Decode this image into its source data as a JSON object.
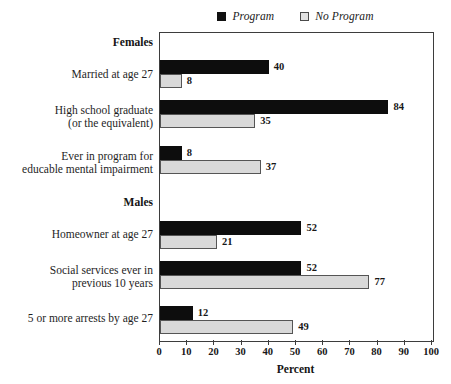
{
  "chart_data": {
    "type": "bar",
    "orientation": "horizontal",
    "title": "",
    "xlabel": "Percent",
    "ylabel": "",
    "xlim": [
      0,
      100
    ],
    "xticks": [
      0,
      10,
      20,
      30,
      40,
      50,
      60,
      70,
      80,
      90,
      100
    ],
    "grid": false,
    "legend_position": "top-center",
    "series": [
      {
        "name": "Program",
        "color": "#0d0d0d"
      },
      {
        "name": "No Program",
        "color": "#d9d9d9"
      }
    ],
    "groups": [
      {
        "name": "Females",
        "categories": [
          {
            "label": "Married at age 27",
            "label_lines": [
              "Married at age 27"
            ],
            "values": {
              "Program": 40,
              "No Program": 8
            }
          },
          {
            "label": "High school graduate (or the equivalent)",
            "label_lines": [
              "High school graduate",
              "(or the equivalent)"
            ],
            "values": {
              "Program": 84,
              "No Program": 35
            }
          },
          {
            "label": "Ever in program for educable mental impairment",
            "label_lines": [
              "Ever in program for",
              "educable mental impairment"
            ],
            "values": {
              "Program": 8,
              "No Program": 37
            }
          }
        ]
      },
      {
        "name": "Males",
        "categories": [
          {
            "label": "Homeowner at age 27",
            "label_lines": [
              "Homeowner at age 27"
            ],
            "values": {
              "Program": 52,
              "No Program": 21
            }
          },
          {
            "label": "Social services ever in previous 10 years",
            "label_lines": [
              "Social services ever in",
              "previous 10 years"
            ],
            "values": {
              "Program": 52,
              "No Program": 77
            }
          },
          {
            "label": "5 or more arrests by age 27",
            "label_lines": [
              "5 or more arrests by age 27"
            ],
            "values": {
              "Program": 12,
              "No Program": 49
            }
          }
        ]
      }
    ]
  },
  "legend": {
    "items": [
      {
        "label": "Program",
        "swatch": "filled-black-square"
      },
      {
        "label": "No Program",
        "swatch": "outlined-gray-square"
      }
    ]
  },
  "axis": {
    "title": "Percent",
    "ticks": [
      "0",
      "10",
      "20",
      "30",
      "40",
      "50",
      "60",
      "70",
      "80",
      "90",
      "100"
    ]
  },
  "group_labels": [
    "Females",
    "Males"
  ],
  "bar_values": {
    "females_married_program": "40",
    "females_married_noprogram": "8",
    "females_hsgrad_program": "84",
    "females_hsgrad_noprogram": "35",
    "females_emi_program": "8",
    "females_emi_noprogram": "37",
    "males_homeowner_program": "52",
    "males_homeowner_noprogram": "21",
    "males_socialsvc_program": "52",
    "males_socialsvc_noprogram": "77",
    "males_arrests_program": "12",
    "males_arrests_noprogram": "49"
  },
  "colors": {
    "program": "#0d0d0d",
    "no_program": "#d9d9d9",
    "no_program_border": "#555555",
    "frame": "#3d3d3d",
    "text": "#1a1a1a"
  }
}
